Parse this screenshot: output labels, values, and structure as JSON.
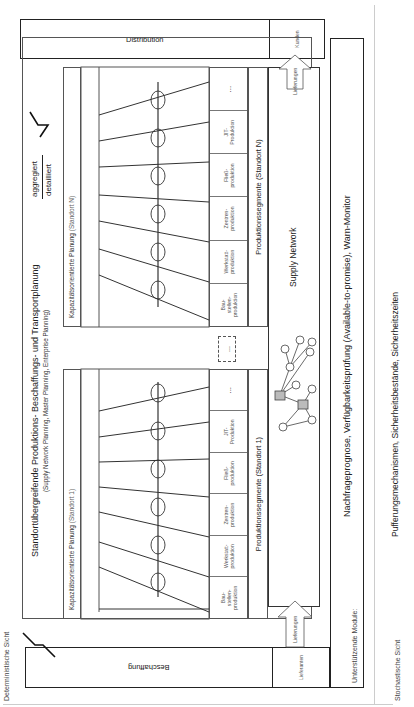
{
  "views": {
    "deterministic": "Deterministische Sicht",
    "stochastic": "Stochastische Sicht"
  },
  "procurement": {
    "label": "Beschaffung",
    "suppliers": "Lieferanten"
  },
  "distribution": {
    "label": "Distribution",
    "customers": "Kunden"
  },
  "arrows": {
    "inbound": "Lieferungen",
    "outbound": "Lieferungen"
  },
  "master_planning": {
    "title": "Standortübergreifende Produktions- Beschaffungs- und Transportplanung",
    "subtitle": "(Supply Network Planning, Master Planning, Enterprise Planning)",
    "level_top": "aggregiert",
    "level_bottom": "detailliert"
  },
  "sites": [
    {
      "capacity_planning": "Kapazitätsorientierte Planung",
      "capacity_site": "(Standort 1)",
      "segments_label": "Produktionssegmente (Standort 1)",
      "segments": [
        "Bau-\nstellen-\nproduktion",
        "Werkstatt-\nproduktion",
        "Zentren-\nproduktion",
        "Fließ-\nproduktion",
        "JIT-\nProduktion",
        "..."
      ]
    },
    {
      "capacity_planning": "Kapazitätsorientierte Planung",
      "capacity_site": "(Standort N)",
      "segments_label": "Produktionssegmente (Standort N)",
      "segments": [
        "Bau-\nstellen-\nproduktion",
        "Werkstatt-\nproduktion",
        "Zentren-\nproduktion",
        "Fließ-\nproduktion",
        "JIT-\nProduktion",
        "..."
      ]
    }
  ],
  "between_sites": "...",
  "supply_network": {
    "label": "Supply Network"
  },
  "support_modules": {
    "label": "Unterstützende Module:",
    "text": "Nachfrageprognose, Verfügbarkeitsprüfung (Available-to-promise), Warn-Monitor"
  },
  "stochastic_text": "Pufferungsmechanismen, Sicherheitsbestände, Sicherheitszeiten",
  "colors": {
    "line": "#222222",
    "text": "#222222",
    "muted": "#666666",
    "background": "#ffffff"
  }
}
